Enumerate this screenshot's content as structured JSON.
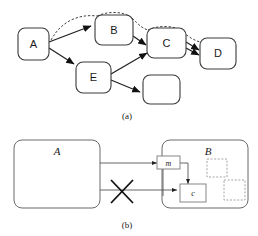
{
  "figure": {
    "panels": [
      {
        "id": "panel-a",
        "caption": "(a)",
        "nodes": [
          {
            "id": "a",
            "label": "A"
          },
          {
            "id": "b",
            "label": "B"
          },
          {
            "id": "c",
            "label": "C"
          },
          {
            "id": "d",
            "label": "D"
          },
          {
            "id": "e",
            "label": "E"
          },
          {
            "id": "blank",
            "label": ""
          }
        ],
        "edges": [
          {
            "from": "A",
            "to": "B",
            "style": "solid"
          },
          {
            "from": "A",
            "to": "E",
            "style": "solid"
          },
          {
            "from": "B",
            "to": "C",
            "style": "solid"
          },
          {
            "from": "C",
            "to": "D",
            "style": "solid"
          },
          {
            "from": "E",
            "to": "C",
            "style": "solid"
          },
          {
            "from": "E",
            "to": "blank",
            "style": "solid"
          },
          {
            "from": "A",
            "to": "B",
            "style": "dashed"
          },
          {
            "from": "B",
            "to": "C",
            "style": "dashed"
          },
          {
            "from": "C",
            "to": "D",
            "style": "dashed"
          }
        ]
      },
      {
        "id": "panel-b",
        "caption": "(b)",
        "nodes": [
          {
            "id": "a",
            "label": "A"
          },
          {
            "id": "b",
            "label": "B"
          },
          {
            "id": "m",
            "label": "m"
          },
          {
            "id": "c",
            "label": "c"
          },
          {
            "id": "slot1",
            "label": ""
          },
          {
            "id": "slot2",
            "label": ""
          }
        ],
        "edges": [
          {
            "from": "A",
            "to": "m",
            "style": "solid"
          },
          {
            "from": "m",
            "to": "c",
            "style": "solid"
          },
          {
            "from": "A",
            "to": "c",
            "style": "blocked"
          }
        ],
        "markers": [
          {
            "id": "blocked-cross",
            "symbol": "X"
          }
        ]
      }
    ]
  }
}
